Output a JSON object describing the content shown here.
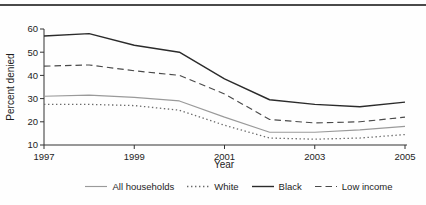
{
  "figure": {
    "top_rule_color": "#4a4a4a",
    "background_color": "#fefefe"
  },
  "chart_data": {
    "type": "line",
    "title": "",
    "xlabel": "Year",
    "ylabel": "Percent denied",
    "xlim": [
      1997,
      2005
    ],
    "ylim": [
      10,
      60
    ],
    "x_ticks": [
      1997,
      1999,
      2001,
      2003,
      2005
    ],
    "y_ticks": [
      10,
      20,
      30,
      40,
      50,
      60
    ],
    "grid": false,
    "legend_position": "bottom",
    "axis_color": "#333333",
    "x": [
      1997,
      1998,
      1999,
      2000,
      2001,
      2002,
      2003,
      2004,
      2005
    ],
    "series": [
      {
        "name": "All households",
        "style": "solid",
        "color": "#9a9a9a",
        "values": [
          31,
          31.5,
          30.5,
          29,
          22,
          15.5,
          15.5,
          16.5,
          18
        ]
      },
      {
        "name": "White",
        "style": "dotted",
        "color": "#6a6a6a",
        "values": [
          27.5,
          27.5,
          27,
          25,
          18.5,
          13,
          12.5,
          13,
          14.5
        ]
      },
      {
        "name": "Black",
        "style": "solid",
        "color": "#2b2b2b",
        "values": [
          57,
          58,
          53,
          50,
          38.5,
          29.5,
          27.5,
          26.5,
          28.5
        ]
      },
      {
        "name": "Low income",
        "style": "dashed",
        "color": "#4a4a4a",
        "values": [
          44,
          44.5,
          42,
          40,
          32,
          21,
          19.5,
          20,
          22
        ]
      }
    ]
  }
}
